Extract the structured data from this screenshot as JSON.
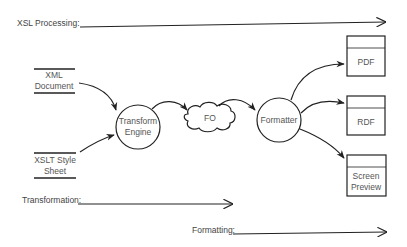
{
  "diagram": {
    "phases": {
      "xsl_processing": "XSL Processing:",
      "transformation": "Transformation:",
      "formatting": "Formatting:"
    },
    "inputs": {
      "xml_document": [
        "XML",
        "Document"
      ],
      "xslt_style_sheet": [
        "XSLT Style",
        "Sheet"
      ]
    },
    "processes": {
      "transform_engine": [
        "Transform",
        "Engine"
      ],
      "formatter": "Formatter"
    },
    "intermediate": {
      "fo": "FO"
    },
    "outputs": [
      {
        "label": [
          "PDF"
        ]
      },
      {
        "label": [
          "RDF"
        ]
      },
      {
        "label": [
          "Screen",
          "Preview"
        ]
      }
    ],
    "colors": {
      "stroke": "#222222",
      "text": "#444444",
      "background": "#ffffff"
    }
  }
}
